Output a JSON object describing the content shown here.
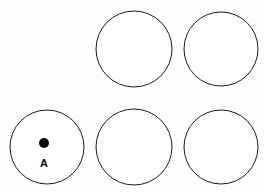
{
  "figure": {
    "name": "circle-grid-diagram",
    "width": 265,
    "height": 193,
    "background_color": "#fefefe",
    "stroke_color": "#1a1a1a",
    "fill_color": "#ffffff",
    "marker_color": "#0a0a0a",
    "grid": {
      "rows": 2,
      "columns": 3,
      "empty_cells": [
        "row-0-col-0"
      ]
    },
    "circles": [
      {
        "id": "circle-top-middle",
        "row": 0,
        "column": 1,
        "cx": 134,
        "cy": 49,
        "r": 38,
        "filled": false
      },
      {
        "id": "circle-top-right",
        "row": 0,
        "column": 2,
        "cx": 221,
        "cy": 49,
        "r": 37,
        "filled": false
      },
      {
        "id": "circle-bottom-left",
        "row": 1,
        "column": 0,
        "cx": 47,
        "cy": 147,
        "r": 37,
        "filled": false
      },
      {
        "id": "circle-bottom-middle",
        "row": 1,
        "column": 1,
        "cx": 134,
        "cy": 147,
        "r": 38,
        "filled": false
      },
      {
        "id": "circle-bottom-right",
        "row": 1,
        "column": 2,
        "cx": 221,
        "cy": 147,
        "r": 37,
        "filled": false
      }
    ],
    "markers": [
      {
        "id": "marker-a",
        "label": "A",
        "cx": 44,
        "cy": 143,
        "r": 5,
        "label_x": 44,
        "label_y": 164,
        "inside_circle": "circle-bottom-left"
      }
    ]
  }
}
